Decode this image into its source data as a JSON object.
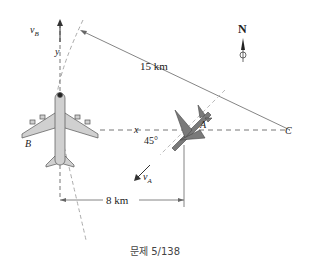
{
  "diagram": {
    "compass_label": "N",
    "distance_bc_label": "15 km",
    "distance_x_label": "8 km",
    "angle_label": "45°",
    "vb_label": "v",
    "vb_sub": "B",
    "va_label": "v",
    "va_sub": "A",
    "x_axis_label": "x",
    "y_axis_label": "y",
    "point_a": "A",
    "point_b": "B",
    "point_c": "C",
    "colors": {
      "line": "#555555",
      "dash": "#888888",
      "plane_fill": "#cfcfcf",
      "jet_fill": "#7a7a7a"
    }
  },
  "caption": "문제 5/138"
}
